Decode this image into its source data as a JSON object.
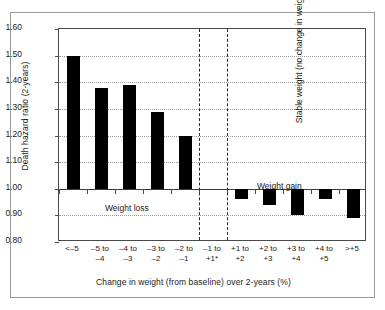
{
  "chart_data": {
    "type": "bar",
    "title": "",
    "xlabel": "Change in weight (from baseline) over 2-years (%)",
    "ylabel": "Death hazard ratio (2-years)",
    "ylim": [
      0.8,
      1.6
    ],
    "ytick_labels": [
      "1.60",
      "1.50",
      "1.40",
      "1.30",
      "1.20",
      "1.10",
      "1.00",
      "0.90",
      "0.80"
    ],
    "ytick_values": [
      1.6,
      1.5,
      1.4,
      1.3,
      1.2,
      1.1,
      1.0,
      0.9,
      0.8
    ],
    "baseline": 1.0,
    "grid": true,
    "legend": "none",
    "categories": [
      "<-5",
      "-5 to -4",
      "-4 to -3",
      "-3 to -2",
      "-2 to -1",
      "-1 to +1*",
      "+1 to +2",
      "+2 to +3",
      "+3 to +4",
      "+4 to +5",
      ">+5"
    ],
    "category_lines": [
      [
        "<–5",
        ""
      ],
      [
        "–5 to",
        "–4"
      ],
      [
        "–4 to",
        "–3"
      ],
      [
        "–3 to",
        "–2"
      ],
      [
        "–2 to",
        "–1"
      ],
      [
        "–1 to",
        "+1*"
      ],
      [
        "+1 to",
        "+2"
      ],
      [
        "+2 to",
        "+3"
      ],
      [
        "+3 to",
        "+4"
      ],
      [
        "+4 to",
        "+5"
      ],
      [
        ">+5",
        ""
      ]
    ],
    "values": [
      1.5,
      1.38,
      1.39,
      1.29,
      1.2,
      null,
      0.96,
      0.94,
      0.9,
      0.96,
      0.89
    ],
    "bar_color": "#000000",
    "annotations": [
      {
        "text": "Weight loss",
        "orientation": "horizontal"
      },
      {
        "text": "Weight gain",
        "orientation": "horizontal"
      },
      {
        "text": "Stable weight  (no change in weight)",
        "orientation": "vertical"
      }
    ]
  },
  "annotations": {
    "weight_loss": "Weight loss",
    "weight_gain": "Weight gain",
    "stable_weight": "Stable weight  (no change in weight)"
  }
}
